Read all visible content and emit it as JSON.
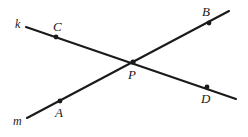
{
  "figure": {
    "type": "geometry-diagram",
    "width": 248,
    "height": 137,
    "background_color": "#ffffff",
    "stroke_color": "#1a1a1a",
    "lines": [
      {
        "id": "line-k",
        "label": "k",
        "label_x": 15,
        "label_y": 18,
        "x1": 26,
        "y1": 27,
        "x2": 236,
        "y2": 99,
        "stroke_width": 2.1
      },
      {
        "id": "line-m",
        "label": "m",
        "label_x": 13,
        "label_y": 115,
        "x1": 27,
        "y1": 118,
        "x2": 229,
        "y2": 11,
        "stroke_width": 2.1
      }
    ],
    "points": [
      {
        "id": "point-c",
        "label": "C",
        "on_line": "k",
        "x": 56,
        "y": 37,
        "radius": 2.4,
        "label_x": 53,
        "label_y": 20
      },
      {
        "id": "point-b",
        "label": "B",
        "on_line": "m",
        "x": 209,
        "y": 23,
        "radius": 2.4,
        "label_x": 202,
        "label_y": 5
      },
      {
        "id": "point-p",
        "label": "P",
        "on_line": "k,m",
        "x": 133,
        "y": 62,
        "radius": 2.6,
        "label_x": 128,
        "label_y": 68
      },
      {
        "id": "point-a",
        "label": "A",
        "on_line": "m",
        "x": 60,
        "y": 101,
        "radius": 2.4,
        "label_x": 55,
        "label_y": 106
      },
      {
        "id": "point-d",
        "label": "D",
        "on_line": "k",
        "x": 207,
        "y": 87,
        "radius": 2.4,
        "label_x": 201,
        "label_y": 92
      }
    ]
  }
}
